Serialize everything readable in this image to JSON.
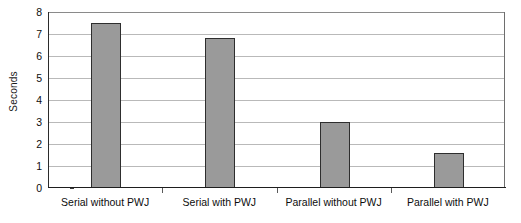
{
  "chart_data": {
    "type": "bar",
    "title": "",
    "xlabel": "",
    "ylabel": "Seconds",
    "categories": [
      "Serial without PWJ",
      "Serial with PWJ",
      "Parallel without PWJ",
      "Parallel with PWJ"
    ],
    "values": [
      7.5,
      6.8,
      3.0,
      1.6
    ],
    "ylim": [
      0,
      8
    ],
    "ytick_labels": [
      "8",
      "7",
      "6",
      "5",
      "4",
      "3",
      "2",
      "1",
      "0"
    ],
    "ytick_values": [
      8,
      7,
      6,
      5,
      4,
      3,
      2,
      1,
      0
    ],
    "grid": true,
    "legend": false,
    "legend_position": "none",
    "bar_fill_color": "#9a9a9a",
    "bar_border_color": "#2e2e2e",
    "gridline_color": "#b9b9b9",
    "axis_color": "#1e1e1e",
    "background_color": "#ffffff"
  }
}
